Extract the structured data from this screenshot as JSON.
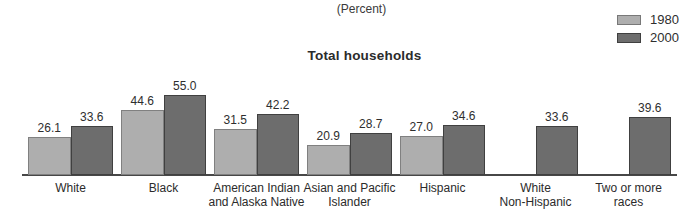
{
  "header": {
    "unit_label": "(Percent)",
    "title": "Total households"
  },
  "legend": {
    "position": "top-right",
    "items": [
      {
        "label": "1980",
        "fill": "#aeaeae",
        "border": "#787878"
      },
      {
        "label": "2000",
        "fill": "#6d6d6d",
        "border": "#3f3f3f"
      }
    ]
  },
  "chart_data": {
    "type": "bar",
    "title": "Total households",
    "unit_label": "(Percent)",
    "categories": [
      "White",
      "Black",
      "American Indian\nand Alaska Native",
      "Asian and Pacific\nIslander",
      "Hispanic",
      "White\nNon-Hispanic",
      "Two or more\nraces"
    ],
    "series": [
      {
        "name": "1980",
        "color": "#aeaeae",
        "border_color": "#808080",
        "values": [
          26.1,
          44.6,
          31.5,
          20.9,
          27.0,
          null,
          null
        ]
      },
      {
        "name": "2000",
        "color": "#6d6d6d",
        "border_color": "#404040",
        "values": [
          33.6,
          55.0,
          42.2,
          28.7,
          34.6,
          33.6,
          39.6
        ]
      }
    ],
    "value_label_decimals": 1,
    "ylim": [
      0,
      55
    ],
    "grid": false,
    "axes": {
      "y_axis_visible": false,
      "x_baseline_visible": true
    },
    "legend_position": "top-right"
  }
}
